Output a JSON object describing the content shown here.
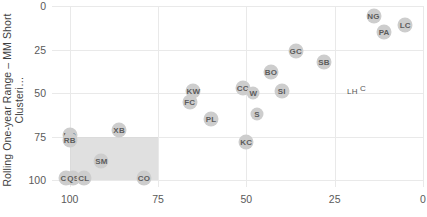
{
  "chart_data": {
    "type": "scatter",
    "title": "",
    "ylabel": "Rolling One-year Range – MM Short\nClusteri…",
    "xlabel": "",
    "xlim": [
      105,
      0
    ],
    "ylim": [
      0,
      104
    ],
    "x_ticks": [
      "100",
      "75",
      "50",
      "25",
      "0"
    ],
    "x_tick_values": [
      100,
      75,
      50,
      25,
      0
    ],
    "y_ticks": [
      "0",
      "25",
      "50",
      "75",
      "100"
    ],
    "y_tick_values": [
      0,
      25,
      50,
      75,
      100
    ],
    "x_axis_reversed": true,
    "grid": true,
    "legend": "none",
    "marker_color": "#cdcdcd",
    "label_color": "#5c5c5c",
    "highlight_region": {
      "x_start": 100,
      "x_end": 75,
      "y_start": 75,
      "y_end": 100,
      "color": "#d5d5d5"
    },
    "points": [
      {
        "label": "NG",
        "x": 14,
        "y": 6,
        "style": "marker"
      },
      {
        "label": "LC",
        "x": 5,
        "y": 11,
        "style": "marker"
      },
      {
        "label": "PA",
        "x": 11,
        "y": 15,
        "style": "marker"
      },
      {
        "label": "GC",
        "x": 36,
        "y": 26,
        "style": "marker"
      },
      {
        "label": "SB",
        "x": 28,
        "y": 32,
        "style": "marker"
      },
      {
        "label": "BO",
        "x": 43,
        "y": 38,
        "style": "marker"
      },
      {
        "label": "CC",
        "x": 51,
        "y": 47,
        "style": "marker"
      },
      {
        "label": "W",
        "x": 48,
        "y": 50,
        "style": "marker"
      },
      {
        "label": "SI",
        "x": 40,
        "y": 49,
        "style": "marker"
      },
      {
        "label": "LH",
        "x": 20,
        "y": 49,
        "style": "plain"
      },
      {
        "label": "C",
        "x": 17,
        "y": 47,
        "style": "plain"
      },
      {
        "label": "KW",
        "x": 65,
        "y": 49,
        "style": "marker"
      },
      {
        "label": "FC",
        "x": 66,
        "y": 55,
        "style": "marker"
      },
      {
        "label": "S",
        "x": 47,
        "y": 62,
        "style": "marker"
      },
      {
        "label": "PL",
        "x": 60,
        "y": 65,
        "style": "marker"
      },
      {
        "label": "KC",
        "x": 50,
        "y": 78,
        "style": "marker"
      },
      {
        "label": "XB",
        "x": 86,
        "y": 71,
        "style": "marker"
      },
      {
        "label": "HO",
        "x": 100,
        "y": 74,
        "style": "marker"
      },
      {
        "label": "RB",
        "x": 100,
        "y": 77,
        "style": "marker"
      },
      {
        "label": "SM",
        "x": 91,
        "y": 89,
        "style": "marker"
      },
      {
        "label": "CT",
        "x": 101,
        "y": 99,
        "style": "marker"
      },
      {
        "label": "QS",
        "x": 99,
        "y": 99,
        "style": "marker"
      },
      {
        "label": "CL",
        "x": 96,
        "y": 99,
        "style": "marker"
      },
      {
        "label": "CO",
        "x": 79,
        "y": 99,
        "style": "marker"
      }
    ]
  }
}
